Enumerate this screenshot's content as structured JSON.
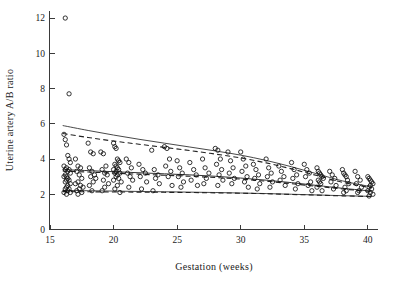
{
  "figure": {
    "background": "#ffffff",
    "point_color": "#111111",
    "line_color": "#333333"
  },
  "chart_data": {
    "type": "scatter",
    "title": "",
    "xlabel": "Gestation (weeks)",
    "ylabel": "Uterine artery A/B ratio",
    "xlim": [
      15,
      40.8
    ],
    "ylim": [
      0,
      12.4
    ],
    "xticks": [
      15,
      20,
      25,
      30,
      35,
      40
    ],
    "yticks": [
      0,
      2,
      4,
      6,
      8,
      10,
      12
    ],
    "xtick_labels": [
      "15",
      "20",
      "25",
      "30",
      "35",
      "40"
    ],
    "ytick_labels": [
      "0",
      "2",
      "4",
      "6",
      "8",
      "10",
      "12"
    ],
    "grid": false,
    "legend": "none",
    "marker": "open-circle",
    "marker_size_px": 3.1,
    "series": [
      {
        "name": "Uterine artery A/B ratio measurements",
        "x": [
          16.2,
          16.5,
          16.1,
          16.2,
          16.3,
          16.4,
          16.5,
          16.6,
          16.1,
          16.3,
          16.5,
          16.2,
          16.4,
          16.6,
          16.2,
          16.3,
          16.1,
          16.4,
          16.5,
          16.3,
          16.2,
          16.6,
          16.4,
          16.3,
          16.5,
          16.2,
          16.4,
          16.1,
          16.6,
          16.3,
          17.0,
          17.2,
          17.4,
          17.1,
          17.3,
          17.5,
          17.2,
          17.0,
          17.4,
          17.6,
          17.3,
          17.1,
          17.5,
          17.2,
          18.0,
          18.2,
          18.4,
          18.1,
          18.3,
          18.5,
          18.2,
          18.6,
          18.4,
          18.1,
          18.3,
          19.0,
          19.2,
          19.4,
          19.1,
          19.3,
          19.5,
          19.2,
          19.6,
          19.3,
          19.1,
          20.0,
          20.1,
          20.2,
          20.3,
          20.4,
          20.5,
          20.1,
          20.2,
          20.3,
          20.0,
          20.4,
          20.2,
          20.5,
          20.1,
          20.3,
          20.2,
          20.4,
          20.0,
          20.6,
          20.3,
          20.1,
          20.5,
          21.0,
          21.2,
          21.4,
          21.1,
          21.3,
          21.5,
          21.2,
          22.0,
          22.3,
          22.5,
          22.1,
          22.6,
          22.2,
          23.0,
          23.2,
          23.5,
          23.3,
          23.6,
          23.1,
          24.0,
          24.2,
          24.4,
          24.1,
          24.5,
          24.3,
          24.6,
          25.0,
          25.2,
          25.4,
          25.1,
          25.5,
          25.3,
          26.0,
          26.3,
          26.5,
          26.1,
          26.6,
          27.0,
          27.2,
          27.5,
          27.3,
          27.1,
          28.0,
          28.2,
          28.4,
          28.1,
          28.5,
          28.3,
          28.6,
          28.2,
          29.0,
          29.2,
          29.4,
          29.1,
          29.5,
          29.3,
          30.0,
          30.2,
          30.4,
          30.1,
          30.5,
          30.3,
          30.6,
          31.0,
          31.2,
          31.4,
          31.1,
          31.5,
          31.3,
          32.0,
          32.2,
          32.4,
          32.1,
          32.5,
          32.3,
          33.0,
          33.2,
          33.4,
          33.1,
          33.5,
          34.0,
          34.2,
          34.4,
          34.1,
          34.5,
          34.3,
          35.0,
          35.2,
          35.4,
          35.1,
          35.5,
          35.3,
          35.6,
          36.0,
          36.1,
          36.2,
          36.3,
          36.4,
          36.5,
          36.1,
          36.2,
          36.3,
          36.0,
          36.4,
          37.0,
          37.2,
          37.4,
          37.1,
          37.5,
          37.3,
          38.0,
          38.1,
          38.2,
          38.3,
          38.4,
          38.5,
          38.2,
          38.3,
          38.1,
          39.0,
          39.2,
          39.4,
          39.1,
          39.5,
          39.3,
          39.2,
          40.0,
          40.1,
          40.2,
          40.3,
          40.4,
          40.2,
          40.1,
          40.3,
          40.0,
          40.2,
          40.4,
          40.1
        ],
        "y": [
          12.0,
          7.7,
          5.4,
          5.1,
          4.8,
          4.2,
          4.0,
          3.8,
          3.6,
          3.5,
          3.4,
          3.4,
          3.3,
          3.2,
          3.1,
          3.0,
          3.0,
          2.9,
          2.8,
          2.8,
          2.7,
          2.6,
          2.5,
          2.4,
          2.3,
          2.3,
          2.2,
          2.1,
          2.1,
          2.0,
          4.0,
          3.6,
          3.5,
          3.3,
          3.1,
          2.9,
          2.7,
          2.6,
          2.5,
          2.4,
          2.3,
          2.2,
          2.1,
          2.0,
          4.9,
          4.4,
          4.3,
          3.5,
          3.3,
          3.1,
          3.0,
          2.9,
          2.7,
          2.5,
          2.2,
          4.4,
          4.3,
          3.6,
          3.4,
          3.2,
          3.1,
          2.8,
          2.6,
          2.4,
          2.2,
          4.9,
          4.7,
          4.6,
          4.0,
          3.9,
          3.8,
          3.7,
          3.6,
          3.5,
          3.4,
          3.4,
          3.3,
          3.2,
          3.2,
          3.1,
          3.0,
          2.9,
          2.8,
          2.7,
          2.5,
          2.3,
          2.1,
          4.0,
          3.8,
          3.5,
          3.2,
          3.0,
          2.8,
          2.4,
          3.7,
          3.4,
          3.2,
          3.0,
          2.7,
          2.3,
          4.5,
          3.4,
          3.1,
          2.9,
          2.6,
          2.2,
          4.7,
          4.6,
          4.0,
          3.6,
          3.3,
          3.0,
          2.5,
          3.9,
          3.5,
          3.2,
          3.0,
          2.7,
          2.4,
          3.8,
          3.4,
          3.1,
          2.8,
          2.5,
          4.0,
          3.5,
          3.2,
          2.9,
          2.6,
          4.6,
          4.5,
          4.0,
          3.7,
          3.4,
          3.1,
          2.8,
          2.5,
          4.4,
          3.9,
          3.5,
          3.2,
          2.9,
          2.6,
          4.4,
          4.0,
          3.6,
          3.3,
          3.0,
          2.7,
          2.4,
          3.7,
          3.4,
          3.1,
          2.9,
          2.6,
          2.3,
          4.0,
          3.5,
          3.2,
          3.0,
          2.7,
          2.4,
          3.6,
          3.3,
          3.0,
          2.8,
          2.5,
          3.8,
          3.4,
          3.1,
          2.9,
          2.6,
          2.3,
          3.7,
          3.4,
          3.2,
          3.0,
          2.7,
          2.5,
          2.2,
          3.5,
          3.3,
          3.2,
          3.1,
          3.0,
          2.9,
          2.8,
          2.7,
          2.6,
          2.4,
          2.2,
          3.3,
          3.1,
          2.9,
          2.7,
          2.5,
          2.3,
          3.4,
          3.2,
          3.1,
          3.0,
          2.8,
          2.6,
          2.4,
          2.2,
          2.1,
          3.3,
          3.0,
          2.8,
          2.6,
          2.4,
          2.2,
          2.1,
          3.0,
          2.9,
          2.8,
          2.7,
          2.6,
          2.5,
          2.4,
          2.3,
          2.2,
          2.1,
          2.0,
          1.9
        ]
      }
    ],
    "reference_curves": [
      {
        "name": "upper-centile-solid",
        "style": "solid",
        "x": [
          16.0,
          18.0,
          20.0,
          22.0,
          24.0,
          26.0,
          28.0,
          30.0,
          32.0,
          34.0,
          36.0,
          38.0,
          40.3
        ],
        "y": [
          5.9,
          5.62,
          5.36,
          5.12,
          4.9,
          4.68,
          4.46,
          4.22,
          3.92,
          3.56,
          3.16,
          2.76,
          2.42
        ]
      },
      {
        "name": "upper-centile-dashed",
        "style": "dashed",
        "x": [
          16.0,
          18.0,
          20.0,
          22.0,
          24.0,
          26.0,
          28.0,
          30.0,
          32.0,
          34.0,
          36.0,
          38.0,
          40.3
        ],
        "y": [
          5.45,
          5.22,
          5.02,
          4.84,
          4.66,
          4.48,
          4.28,
          4.06,
          3.78,
          3.44,
          3.06,
          2.68,
          2.36
        ]
      },
      {
        "name": "median-solid",
        "style": "solid",
        "x": [
          16.0,
          18.0,
          20.0,
          22.0,
          24.0,
          26.0,
          28.0,
          30.0,
          32.0,
          34.0,
          36.0,
          38.0,
          40.3
        ],
        "y": [
          3.4,
          3.34,
          3.28,
          3.22,
          3.16,
          3.1,
          3.02,
          2.92,
          2.8,
          2.66,
          2.5,
          2.34,
          2.18
        ]
      },
      {
        "name": "median-dashed",
        "style": "dashed",
        "x": [
          16.0,
          18.0,
          20.0,
          22.0,
          24.0,
          26.0,
          28.0,
          30.0,
          32.0,
          34.0,
          36.0,
          38.0,
          40.3
        ],
        "y": [
          3.32,
          3.26,
          3.2,
          3.14,
          3.08,
          3.02,
          2.95,
          2.86,
          2.74,
          2.6,
          2.45,
          2.3,
          2.15
        ]
      },
      {
        "name": "lower-centile-solid",
        "style": "solid",
        "x": [
          16.0,
          18.0,
          20.0,
          22.0,
          24.0,
          26.0,
          28.0,
          30.0,
          32.0,
          34.0,
          36.0,
          38.0,
          40.3
        ],
        "y": [
          2.22,
          2.2,
          2.18,
          2.16,
          2.14,
          2.12,
          2.1,
          2.07,
          2.04,
          2.0,
          1.96,
          1.92,
          1.88
        ]
      },
      {
        "name": "lower-centile-dashed",
        "style": "dashed",
        "x": [
          16.0,
          18.0,
          20.0,
          22.0,
          24.0,
          26.0,
          28.0,
          30.0,
          32.0,
          34.0,
          36.0,
          38.0,
          40.3
        ],
        "y": [
          2.15,
          2.14,
          2.13,
          2.12,
          2.11,
          2.1,
          2.08,
          2.06,
          2.03,
          1.99,
          1.95,
          1.91,
          1.87
        ]
      }
    ]
  }
}
